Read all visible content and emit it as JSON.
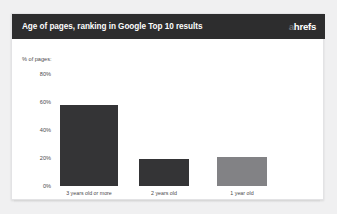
{
  "card": {
    "title": "Age of pages, ranking in Google Top 10 results",
    "brand": {
      "accent_letter": "a",
      "rest": "hrefs",
      "accent_color": "#6e6e70",
      "text_color": "#ffffff"
    },
    "header_bg": "#2d2d2e",
    "background": "#ffffff"
  },
  "chart_data": {
    "type": "bar",
    "title": "Age of pages, ranking in Google Top 10 results",
    "subtitle": "",
    "xlabel": "",
    "ylabel": "% of pages:",
    "axis_caption": "% of pages:",
    "categories": [
      "3 years old or more",
      "2 years old",
      "1 year old"
    ],
    "values": [
      58,
      19,
      21
    ],
    "value_labels": [
      "",
      "",
      ""
    ],
    "ylim": [
      0,
      80
    ],
    "ytick_values": [
      0,
      20,
      40,
      60,
      80
    ],
    "ytick_labels": [
      "0%",
      "20%",
      "40%",
      "60%",
      "80%"
    ],
    "grid": false,
    "legend": false,
    "legend_position": "none",
    "bar_colors": [
      "#343436",
      "#343436",
      "#828285"
    ],
    "series": [
      {
        "name": "% of pages",
        "values": [
          58,
          19,
          21
        ]
      }
    ]
  }
}
